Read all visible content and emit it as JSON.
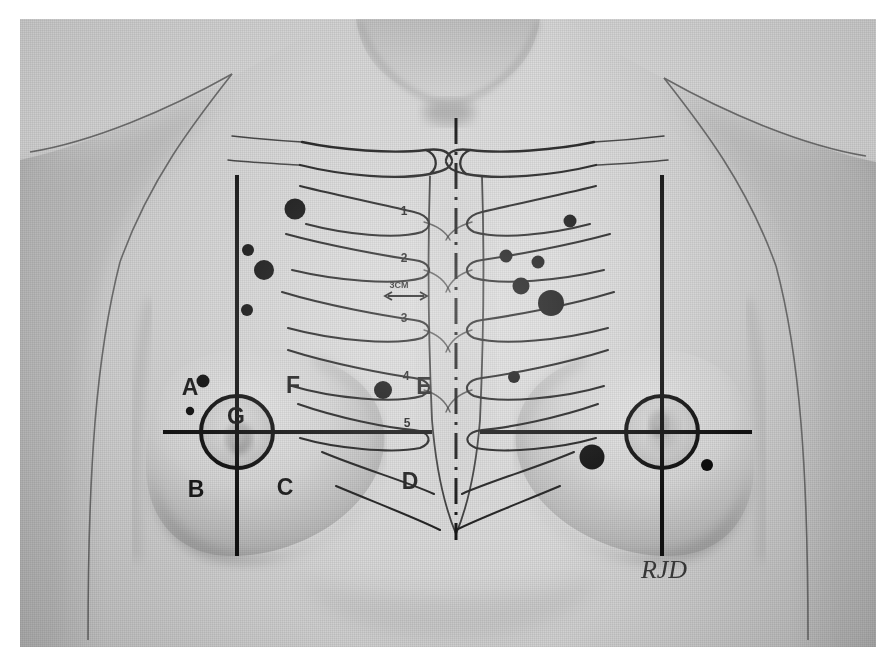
{
  "figure": {
    "kind": "anatomical-photograph-diagram",
    "signature": "RJD",
    "plate_background_hex": "#d2d2d2",
    "ink_hex": "#111111",
    "paper_hex": "#ffffff"
  },
  "quadrant_labels": [
    {
      "id": "A",
      "text": "A",
      "x": 190,
      "y": 395,
      "region": "left-breast-upper-outer"
    },
    {
      "id": "B",
      "text": "B",
      "x": 196,
      "y": 497,
      "region": "left-breast-lower-outer"
    },
    {
      "id": "C",
      "text": "C",
      "x": 285,
      "y": 495,
      "region": "left-breast-lower-inner"
    },
    {
      "id": "D",
      "text": "D",
      "x": 410,
      "y": 489,
      "region": "epigastric-xiphoid"
    },
    {
      "id": "E",
      "text": "E",
      "x": 424,
      "y": 394,
      "region": "parasternal-rib-4"
    },
    {
      "id": "F",
      "text": "F",
      "x": 293,
      "y": 393,
      "region": "left-breast-upper-inner"
    },
    {
      "id": "G",
      "text": "G",
      "x": 236,
      "y": 424,
      "region": "nipple-areola"
    }
  ],
  "rib_labels": [
    {
      "text": "1",
      "x": 404,
      "y": 215
    },
    {
      "text": "2",
      "x": 404,
      "y": 262
    },
    {
      "text": "3",
      "x": 404,
      "y": 322
    },
    {
      "text": "4",
      "x": 406,
      "y": 380
    },
    {
      "text": "5",
      "x": 407,
      "y": 427
    }
  ],
  "measurement": {
    "text": "3CM",
    "x": 399,
    "y": 288
  },
  "lesions": [
    {
      "cx": 295,
      "cy": 209,
      "r": 10.5,
      "side": "left-chest"
    },
    {
      "cx": 248,
      "cy": 250,
      "r": 6.0,
      "side": "left-chest"
    },
    {
      "cx": 264,
      "cy": 270,
      "r": 10.0,
      "side": "left-chest"
    },
    {
      "cx": 247,
      "cy": 310,
      "r": 6.0,
      "side": "left-chest"
    },
    {
      "cx": 203,
      "cy": 381,
      "r": 6.5,
      "side": "left-breast-upper-outer"
    },
    {
      "cx": 190,
      "cy": 411,
      "r": 4.2,
      "side": "left-breast-upper-outer"
    },
    {
      "cx": 383,
      "cy": 390,
      "r": 9.0,
      "side": "left-parasternal-rib-4"
    },
    {
      "cx": 570,
      "cy": 221,
      "r": 6.5,
      "side": "right-chest"
    },
    {
      "cx": 506,
      "cy": 256,
      "r": 6.5,
      "side": "right-chest"
    },
    {
      "cx": 538,
      "cy": 262,
      "r": 6.5,
      "side": "right-chest"
    },
    {
      "cx": 521,
      "cy": 286,
      "r": 8.5,
      "side": "right-chest"
    },
    {
      "cx": 551,
      "cy": 303,
      "r": 13.0,
      "side": "right-chest"
    },
    {
      "cx": 514,
      "cy": 377,
      "r": 6.0,
      "side": "right-chest"
    },
    {
      "cx": 592,
      "cy": 457,
      "r": 12.5,
      "side": "right-breast-upper-outer"
    },
    {
      "cx": 707,
      "cy": 465,
      "r": 6.0,
      "side": "right-breast-lower-inner"
    }
  ],
  "guides": {
    "left_midclavicular_x": 237,
    "right_midclavicular_x": 662,
    "midsternal_x": 456,
    "left_horizontal_y": 432,
    "right_horizontal_y": 432
  },
  "areolae": [
    {
      "side": "left",
      "cx": 237,
      "cy": 432,
      "r": 36
    },
    {
      "side": "right",
      "cx": 662,
      "cy": 432,
      "r": 36
    }
  ]
}
